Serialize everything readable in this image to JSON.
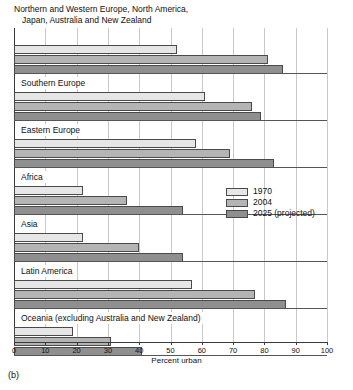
{
  "figure": {
    "caption": "(b)",
    "title_line_1": "Northern and Western Europe, North America,",
    "title_line_2": "Japan, Australia and New Zealand"
  },
  "legend": {
    "items": [
      {
        "label": "1970",
        "color": "#e6e6e6"
      },
      {
        "label": "2004",
        "color": "#b4b4b4"
      },
      {
        "label": "2025 (projected)",
        "color": "#8f8f8f"
      }
    ]
  },
  "chart_data": {
    "type": "bar",
    "orientation": "horizontal",
    "title": "Northern and Western Europe, North America, Japan, Australia and New Zealand",
    "xlabel": "Percent urban",
    "ylabel": "",
    "xlim": [
      0,
      100
    ],
    "xticks": [
      0,
      10,
      20,
      30,
      40,
      50,
      60,
      70,
      80,
      90,
      100
    ],
    "grid": true,
    "legend_position": "middle-right",
    "categories": [
      "Northern and Western Europe, North America, Japan, Australia and New Zealand",
      "Southern Europe",
      "Eastern Europe",
      "Africa",
      "Asia",
      "Latin America",
      "Oceania (excluding Australia and New Zealand)"
    ],
    "series": [
      {
        "name": "1970",
        "color": "#e6e6e6",
        "values": [
          52,
          61,
          58,
          22,
          22,
          57,
          19
        ]
      },
      {
        "name": "2004",
        "color": "#b4b4b4",
        "values": [
          81,
          76,
          69,
          36,
          40,
          77,
          31
        ]
      },
      {
        "name": "2025 (projected)",
        "color": "#8f8f8f",
        "values": [
          86,
          79,
          83,
          54,
          54,
          87,
          41
        ]
      }
    ]
  }
}
